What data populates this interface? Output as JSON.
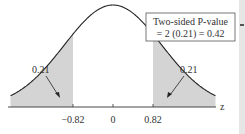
{
  "chart_data": {
    "type": "area",
    "title": "",
    "xlabel": "z",
    "ylabel": "",
    "xlim": [
      -2.1,
      2.1
    ],
    "x_ticks": [
      -0.82,
      0,
      0.82
    ],
    "x_tick_labels": [
      "−0.82",
      "0",
      "0.82"
    ],
    "shaded_regions": [
      {
        "from": -2.1,
        "to": -0.82,
        "area": 0.21,
        "label": "0.21"
      },
      {
        "from": 0.82,
        "to": 2.1,
        "area": 0.21,
        "label": "0.21"
      }
    ],
    "annotation": {
      "line1": "Two-sided P-value",
      "line2": "= 2 (0.21) = 0.42"
    },
    "grid": false,
    "colors": {
      "curve": "#222222",
      "shade": "#d4d4d4",
      "axis": "#333333",
      "box_border": "#555555"
    }
  }
}
